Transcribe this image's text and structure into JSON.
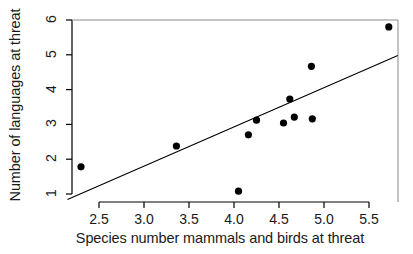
{
  "chart_data": {
    "type": "scatter",
    "title": "",
    "xlabel": "Species number mammals and birds at threat",
    "ylabel": "Number of languages at threat",
    "xlim": [
      2.15,
      5.87
    ],
    "ylim": [
      0.78,
      6.1
    ],
    "xticks": [
      "2.5",
      "3.0",
      "3.5",
      "4.0",
      "4.5",
      "5.0",
      "5.5"
    ],
    "xtick_values": [
      2.5,
      3.0,
      3.5,
      4.0,
      4.5,
      5.0,
      5.5
    ],
    "yticks": [
      "1",
      "2",
      "3",
      "4",
      "5",
      "6"
    ],
    "ytick_values": [
      1,
      2,
      3,
      4,
      5,
      6
    ],
    "grid": false,
    "legend": "none",
    "marker": "filled-circle",
    "marker_color": "#000000",
    "axis_color": "#000000",
    "background": "#ffffff",
    "points": [
      {
        "x": 2.3,
        "y": 1.78
      },
      {
        "x": 3.36,
        "y": 2.38
      },
      {
        "x": 4.05,
        "y": 1.08
      },
      {
        "x": 4.16,
        "y": 2.7
      },
      {
        "x": 4.25,
        "y": 3.12
      },
      {
        "x": 4.55,
        "y": 3.04
      },
      {
        "x": 4.62,
        "y": 3.73
      },
      {
        "x": 4.67,
        "y": 3.21
      },
      {
        "x": 4.86,
        "y": 4.67
      },
      {
        "x": 4.87,
        "y": 3.16
      },
      {
        "x": 5.72,
        "y": 5.8
      }
    ],
    "trendline": {
      "label": "regression line",
      "x_start": 2.15,
      "y_start": 0.84,
      "x_end": 5.82,
      "y_end": 4.98
    }
  }
}
